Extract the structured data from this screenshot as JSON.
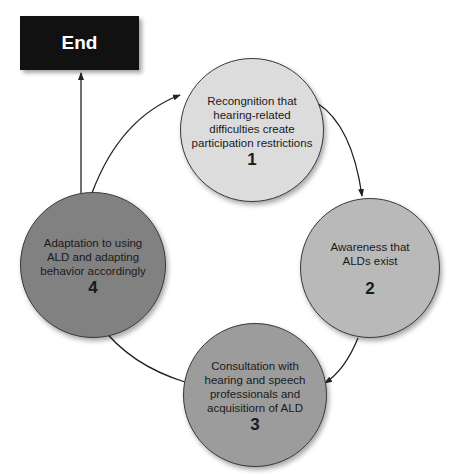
{
  "end_box": {
    "label": "End"
  },
  "nodes": [
    {
      "number": "1",
      "label": "Recongnition that hearing-related difficulties create participation restrictions",
      "color": "#dcdcdc"
    },
    {
      "number": "2",
      "label": "Awareness that ALDs exist",
      "color": "#b9b9b9"
    },
    {
      "number": "3",
      "label": "Consultation with hearing and speech professionals and acquisitiorn of ALD",
      "color": "#9c9c9c"
    },
    {
      "number": "4",
      "label": "Adaptation to using ALD and adapting behavior accordingly",
      "color": "#818181"
    }
  ],
  "arrows": [
    {
      "from": "1",
      "to": "2"
    },
    {
      "from": "2",
      "to": "3"
    },
    {
      "from": "3",
      "to": "4"
    },
    {
      "from": "4",
      "to": "1"
    },
    {
      "from": "4",
      "to": "End"
    }
  ]
}
